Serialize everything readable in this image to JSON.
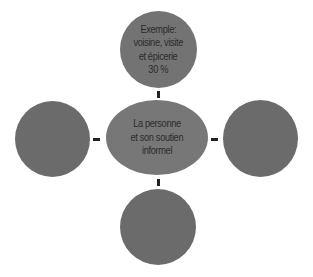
{
  "diagram": {
    "colors": {
      "circle": "#6b6b6b",
      "center": "#777777",
      "top": "#737373",
      "text": "#2b2b2b",
      "connector": "#222222"
    },
    "center": {
      "lines": [
        "La personne",
        "et son soutien",
        "informel"
      ]
    },
    "top": {
      "lines": [
        "Exemple:",
        "voisine, visite",
        "et épicerie",
        "30 %"
      ]
    },
    "left": {
      "lines": []
    },
    "right": {
      "lines": []
    },
    "bottom": {
      "lines": []
    }
  }
}
